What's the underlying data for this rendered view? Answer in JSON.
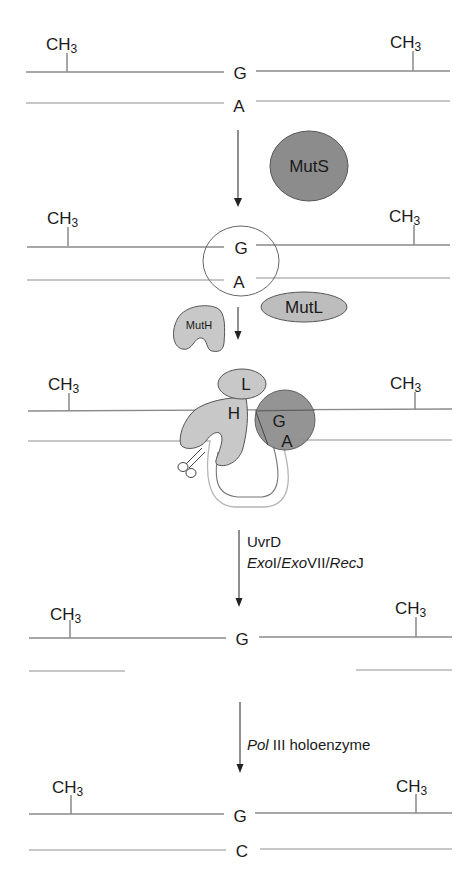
{
  "diagram": {
    "title": "",
    "methyl_label": "CH",
    "methyl_sub": "3",
    "panels": [
      {
        "top_base": "G",
        "bottom_base": "A"
      },
      {
        "top_base": "G",
        "bottom_base": "A"
      },
      {
        "top_base": "G",
        "bottom_base": "A"
      },
      {
        "top_base": "G",
        "bottom_base": ""
      },
      {
        "top_base": "G",
        "bottom_base": "C"
      }
    ],
    "proteins": {
      "muts": "MutS",
      "mutl": "MutL",
      "muth": "MutH",
      "complex_l": "L",
      "complex_h": "H"
    },
    "steps": {
      "step3_line1": "UvrD",
      "step3_line2_parts": [
        "ExoI",
        "/",
        "ExoVII",
        "/",
        "RecJ"
      ],
      "step3_exo1_italic": "Exo",
      "step3_exo1_roman": "I",
      "step3_slash": "/",
      "step3_exo7_italic": "Exo",
      "step3_exo7_roman": "VII",
      "step3_rec_italic": "Rec",
      "step3_rec_roman": "J",
      "step4_italic": "Pol",
      "step4_roman": " III holoenzyme"
    },
    "colors": {
      "muts_fill": "#8c8c8c",
      "mutl_fill": "#bdbdbd",
      "muth_fill": "#c8c8c8",
      "outline": "#555555"
    }
  }
}
